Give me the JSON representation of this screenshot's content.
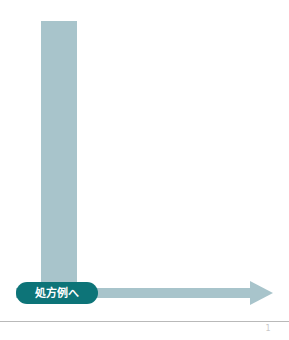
{
  "page": {
    "background_color": "#ffffff",
    "width": 289,
    "height": 340
  },
  "diagram": {
    "type": "l-shaped-flow-arrow",
    "arrow_color": "#a8c4cb",
    "stem": {
      "name": "vertical-arrow-stem",
      "x": 41,
      "y": 21,
      "width": 36,
      "height": 270
    },
    "shaft": {
      "name": "horizontal-arrow-shaft",
      "x": 16,
      "y": 288,
      "width": 238,
      "height": 10
    },
    "arrowhead": {
      "name": "arrow-head-right",
      "direction": "right",
      "tip_x": 273,
      "y_center": 293
    }
  },
  "pill_button": {
    "label": "処方例へ",
    "background_color": "#0d7478",
    "text_color": "#ffffff",
    "x": 16,
    "y": 282,
    "width": 82,
    "height": 22
  },
  "footer": {
    "rule_color": "#b9b9b9",
    "page_number": "1"
  }
}
